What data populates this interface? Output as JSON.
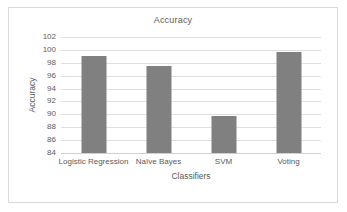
{
  "chart_data": {
    "type": "bar",
    "title": "Accuracy",
    "xlabel": "Classifiers",
    "ylabel": "Accuracy",
    "categories": [
      "Logistic Regression",
      "Naïve Bayes",
      "SVM",
      "Voting"
    ],
    "values": [
      99.0,
      97.5,
      89.8,
      99.7
    ],
    "ylim": [
      84,
      102
    ],
    "ytick_step": 2,
    "yticks": [
      84,
      86,
      88,
      90,
      92,
      94,
      96,
      98,
      100,
      102
    ],
    "ytick_labels": [
      "84",
      "86",
      "88",
      "90",
      "92",
      "94",
      "96",
      "98",
      "100",
      "102"
    ],
    "grid": true,
    "grid_axis": "y",
    "legend": false,
    "legend_position": "none",
    "series": [
      {
        "name": "Accuracy",
        "color": "#808080",
        "values": [
          99.0,
          97.5,
          89.8,
          99.7
        ]
      }
    ]
  },
  "style": {
    "bar_color": "#808080",
    "grid_color": "#dedede",
    "axis_color": "#d0d0d0",
    "text_color": "#5a5a5a",
    "frame_color": "#d9d9d9",
    "background": "#ffffff"
  }
}
